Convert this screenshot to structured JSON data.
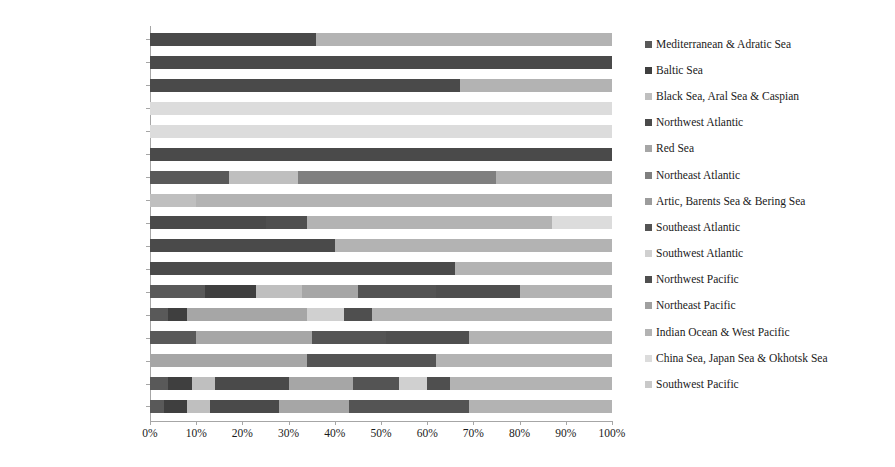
{
  "chart_data": {
    "type": "bar",
    "orientation": "horizontal",
    "stacked": true,
    "normalized_percent": true,
    "title": "",
    "xlabel": "",
    "ylabel": "",
    "xlim": [
      0,
      100
    ],
    "xticks": [
      "0%",
      "10%",
      "20%",
      "30%",
      "40%",
      "50%",
      "60%",
      "70%",
      "80%",
      "90%",
      "100%"
    ],
    "xtick_values": [
      0,
      10,
      20,
      30,
      40,
      50,
      60,
      70,
      80,
      90,
      100
    ],
    "grid": false,
    "legend_position": "right",
    "categories": [
      "Pleuronectiformes",
      "Gadiformes",
      "Syngnathiformes",
      "Atheriniformes",
      "Elopiformes",
      "Characiformes",
      "Gasterosteiformes",
      "Anguilliformes",
      "Cypriniformes",
      "Siluriformes",
      "Tetraodontiformes",
      "Perciformes",
      "Petromyzontiformes",
      "Acipenseriformes",
      "Osmeriformes",
      "Clupeiformes",
      "Salmoniformes"
    ],
    "series": [
      {
        "name": "Mediterranean & Adratic Sea",
        "color": "#595959",
        "values": [
          0,
          0,
          0,
          0,
          0,
          0,
          17,
          0,
          0,
          0,
          0,
          12,
          4,
          10,
          0,
          4,
          3
        ]
      },
      {
        "name": "Baltic Sea",
        "color": "#3f3f3f",
        "values": [
          0,
          0,
          0,
          0,
          0,
          0,
          0,
          0,
          0,
          0,
          0,
          11,
          4,
          0,
          0,
          5,
          5
        ]
      },
      {
        "name": "Black Sea, Aral Sea & Caspian",
        "color": "#bfbfbf",
        "values": [
          0,
          0,
          0,
          0,
          0,
          0,
          15,
          10,
          0,
          0,
          0,
          10,
          0,
          0,
          0,
          5,
          5
        ]
      },
      {
        "name": "Northwest Atlantic",
        "color": "#4a4a4a",
        "values": [
          36,
          100,
          67,
          0,
          0,
          100,
          0,
          0,
          25,
          40,
          66,
          0,
          0,
          0,
          0,
          16,
          15
        ]
      },
      {
        "name": "Red Sea",
        "color": "#a6a6a6",
        "values": [
          0,
          0,
          0,
          0,
          0,
          0,
          0,
          0,
          0,
          0,
          0,
          12,
          26,
          25,
          34,
          14,
          15
        ]
      },
      {
        "name": "Northeast Atlantic",
        "color": "#7f7f7f",
        "values": [
          0,
          0,
          0,
          0,
          0,
          0,
          43,
          0,
          0,
          0,
          0,
          0,
          0,
          0,
          0,
          0,
          0
        ]
      },
      {
        "name": "Artic, Barents Sea & Bering Sea",
        "color": "#9c9c9c",
        "values": [
          0,
          0,
          0,
          0,
          0,
          0,
          0,
          0,
          0,
          0,
          0,
          0,
          0,
          0,
          0,
          0,
          0
        ]
      },
      {
        "name": "Southeast Atlantic",
        "color": "#545454",
        "values": [
          0,
          0,
          0,
          0,
          0,
          0,
          0,
          0,
          0,
          0,
          0,
          17,
          0,
          16,
          28,
          10,
          26
        ]
      },
      {
        "name": "Southwest Atlantic",
        "color": "#d0d0d0",
        "values": [
          0,
          0,
          0,
          0,
          0,
          0,
          0,
          0,
          0,
          0,
          0,
          0,
          8,
          0,
          0,
          6,
          0
        ]
      },
      {
        "name": "Northwest Pacific",
        "color": "#4f4f4f",
        "values": [
          0,
          0,
          0,
          0,
          0,
          0,
          0,
          0,
          9,
          0,
          0,
          18,
          6,
          18,
          0,
          5,
          0
        ]
      },
      {
        "name": "Northeast Pacific",
        "color": "#a0a0a0",
        "values": [
          0,
          0,
          0,
          0,
          0,
          0,
          0,
          0,
          0,
          0,
          0,
          0,
          0,
          0,
          0,
          0,
          0
        ]
      },
      {
        "name": "Indian Ocean & West Pacific",
        "color": "#b3b3b3",
        "values": [
          64,
          0,
          33,
          0,
          0,
          0,
          25,
          90,
          53,
          60,
          34,
          20,
          52,
          31,
          38,
          35,
          31
        ]
      },
      {
        "name": "China Sea, Japan Sea & Okhotsk Sea",
        "color": "#dcdcdc",
        "values": [
          0,
          0,
          0,
          100,
          100,
          0,
          0,
          0,
          13,
          0,
          0,
          0,
          0,
          0,
          0,
          0,
          0
        ]
      },
      {
        "name": "Southwest Pacific",
        "color": "#c9c9c9",
        "values": [
          0,
          0,
          0,
          0,
          0,
          0,
          0,
          0,
          0,
          0,
          0,
          0,
          0,
          0,
          0,
          0,
          0
        ]
      }
    ]
  },
  "legend": {
    "items": [
      {
        "label": "Mediterranean & Adratic Sea",
        "color": "#595959"
      },
      {
        "label": "Baltic Sea",
        "color": "#3f3f3f"
      },
      {
        "label": "Black Sea, Aral Sea & Caspian",
        "color": "#bfbfbf"
      },
      {
        "label": "Northwest Atlantic",
        "color": "#4a4a4a"
      },
      {
        "label": "Red Sea",
        "color": "#a6a6a6"
      },
      {
        "label": "Northeast Atlantic",
        "color": "#7f7f7f"
      },
      {
        "label": "Artic, Barents Sea & Bering Sea",
        "color": "#9c9c9c"
      },
      {
        "label": "Southeast Atlantic",
        "color": "#545454"
      },
      {
        "label": "Southwest Atlantic",
        "color": "#d0d0d0"
      },
      {
        "label": "Northwest Pacific",
        "color": "#4f4f4f"
      },
      {
        "label": "Northeast Pacific",
        "color": "#a0a0a0"
      },
      {
        "label": "Indian Ocean & West Pacific",
        "color": "#b3b3b3"
      },
      {
        "label": "China Sea, Japan Sea & Okhotsk Sea",
        "color": "#dcdcdc"
      },
      {
        "label": "Southwest Pacific",
        "color": "#c9c9c9"
      }
    ]
  },
  "caption": {
    "text": ""
  }
}
